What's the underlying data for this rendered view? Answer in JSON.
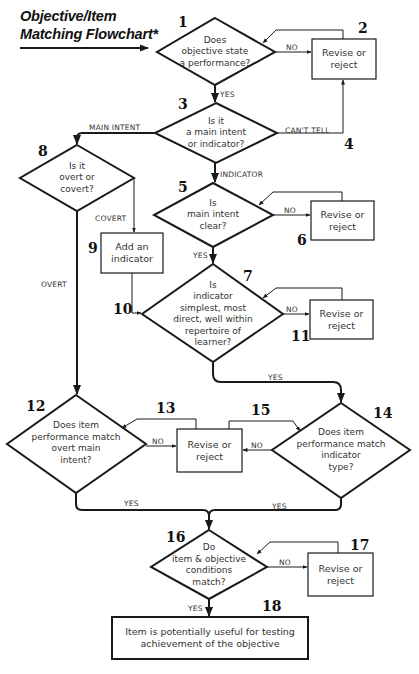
{
  "title": {
    "line1": "Objective/Item",
    "line2": "Matching Flowchart*"
  },
  "nodes": {
    "n1": {
      "number": "1",
      "type": "decision",
      "text": "Does\nobjective state\na performance?"
    },
    "n2": {
      "number": "2",
      "type": "process",
      "text": "Revise or\nreject"
    },
    "n3": {
      "number": "3",
      "type": "decision",
      "text": "Is it\na main intent\nor indicator?"
    },
    "n4": {
      "number": "4"
    },
    "n5": {
      "number": "5",
      "type": "decision",
      "text": "Is\nmain intent\nclear?"
    },
    "n6": {
      "number": "6",
      "type": "process",
      "text": "Revise or\nreject"
    },
    "n7": {
      "number": "7",
      "type": "decision",
      "text": "Is\nindicator\nsimplest, most\ndirect, well within\nrepertoire of\nlearner?"
    },
    "n8": {
      "number": "8",
      "type": "decision",
      "text": "Is it\novert or\ncovert?"
    },
    "n9": {
      "number": "9",
      "type": "process",
      "text": "Add an\nindicator"
    },
    "n10": {
      "number": "10"
    },
    "n11": {
      "number": "11",
      "type": "process",
      "text": "Revise or\nreject"
    },
    "n12": {
      "number": "12",
      "type": "decision",
      "text": "Does item\nperformance match\novert main\nintent?"
    },
    "n13": {
      "number": "13",
      "type": "process",
      "text": "Revise or\nreject"
    },
    "n14": {
      "number": "14",
      "type": "decision",
      "text": "Does item\nperformance match\nindicator\ntype?"
    },
    "n15": {
      "number": "15"
    },
    "n16": {
      "number": "16",
      "type": "decision",
      "text": "Do\nitem & objective\nconditions\nmatch?"
    },
    "n17": {
      "number": "17",
      "type": "process",
      "text": "Revise or\nreject"
    },
    "n18": {
      "number": "18",
      "type": "terminal",
      "text": "Item is potentially useful for testing\nachievement of the objective"
    }
  },
  "edges": {
    "e1_no": "NO",
    "e1_yes": "YES",
    "e3_main": "MAIN INTENT",
    "e3_cant": "CAN'T TELL",
    "e3_ind": "INDICATOR",
    "e5_no": "NO",
    "e5_yes": "YES",
    "e7_no": "NO",
    "e7_yes": "YES",
    "e8_covert": "COVERT",
    "e8_overt": "OVERT",
    "e12_no": "NO",
    "e12_yes": "YES",
    "e14_no": "NO",
    "e14_yes": "YES",
    "e16_no": "NO",
    "e16_yes": "YES"
  },
  "colors": {
    "line": "#1a1a1a",
    "text": "#333333",
    "background": "#ffffff"
  }
}
